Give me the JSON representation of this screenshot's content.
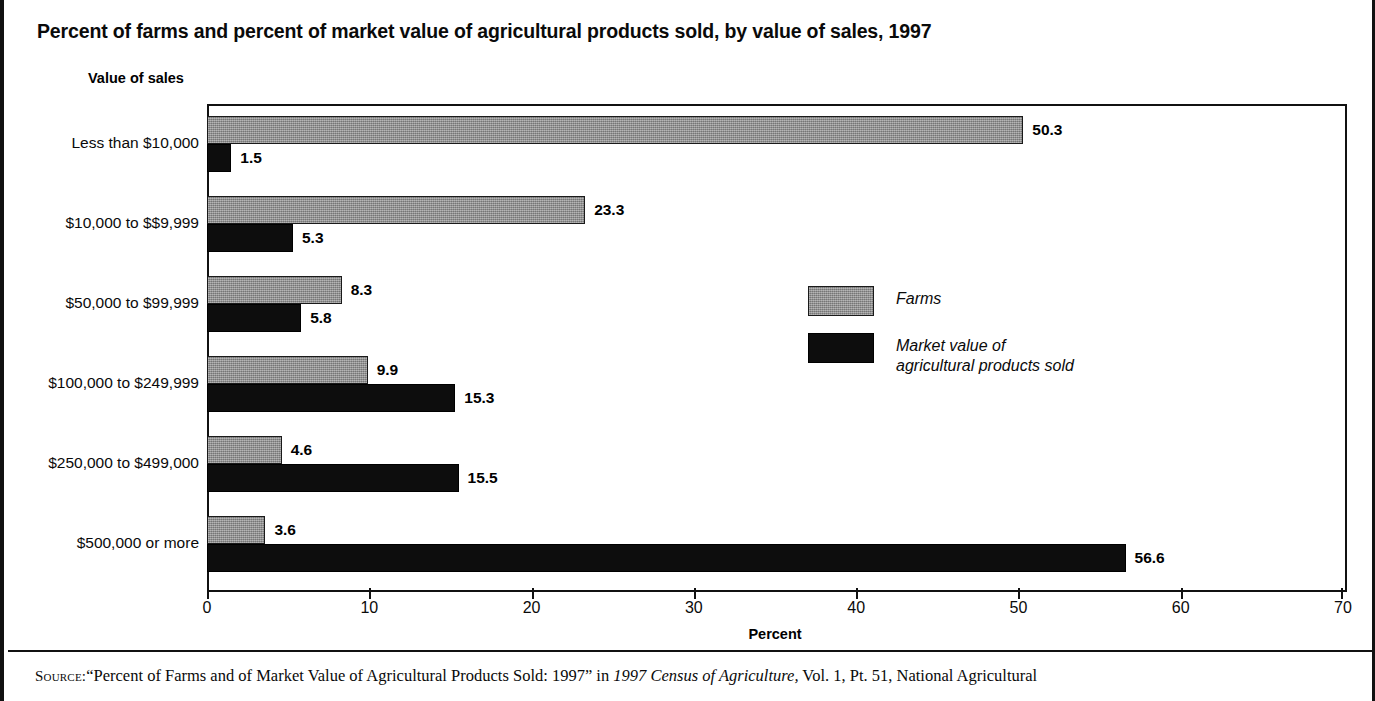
{
  "chart_title": "Percent of farms and percent of market value of agricultural products sold, by value of sales, 1997",
  "y_axis_title": "Value of sales",
  "x_axis_title": "Percent",
  "legend": {
    "farms_label": "Farms",
    "market_label_line1": "Market value of",
    "market_label_line2": "agricultural products sold"
  },
  "source": {
    "keyword": "Source:",
    "part1": "“Percent of Farms and of Market Value of Agricultural Products Sold: 1997” in ",
    "italic": "1997 Census of Agriculture,",
    "part2": " Vol. 1, Pt. 51, National Agricultural"
  },
  "colors": {
    "farms": "#8e8e8e",
    "market": "#0d0d0d",
    "frame": "#111111",
    "background": "#ffffff"
  },
  "chart_data": {
    "type": "bar",
    "orientation": "horizontal",
    "title": "Percent of farms and percent of market value of agricultural products sold, by value of sales, 1997",
    "xlabel": "Percent",
    "ylabel": "Value of sales",
    "xlim": [
      0,
      70
    ],
    "xticks": [
      0,
      10,
      20,
      30,
      40,
      50,
      60,
      70
    ],
    "xtick_labels": [
      "0",
      "10",
      "20",
      "30",
      "40",
      "50",
      "60",
      "70"
    ],
    "grid": false,
    "legend_position": "inside-right",
    "categories": [
      "Less than $10,000",
      "$10,000 to $$9,999",
      "$50,000 to $99,999",
      "$100,000 to $249,999",
      "$250,000 to $499,000",
      "$500,000 or more"
    ],
    "series": [
      {
        "name": "Farms",
        "values": [
          50.3,
          23.3,
          8.3,
          9.9,
          4.6,
          3.6
        ],
        "labels": [
          "50.3",
          "23.3",
          "8.3",
          "9.9",
          "4.6",
          "3.6"
        ],
        "color": "#8e8e8e"
      },
      {
        "name": "Market value of agricultural products sold",
        "values": [
          1.5,
          5.3,
          5.8,
          15.3,
          15.5,
          56.6
        ],
        "labels": [
          "1.5",
          "5.3",
          "5.8",
          "15.3",
          "15.5",
          "56.6"
        ],
        "color": "#0d0d0d"
      }
    ]
  }
}
